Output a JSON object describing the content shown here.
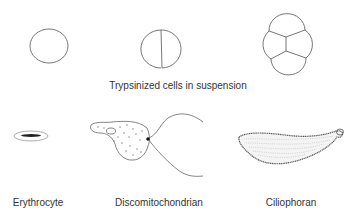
{
  "diagram": {
    "top_row": {
      "caption": "Trypsinized cells in suspension",
      "figures": [
        {
          "name": "single-cell",
          "cells": 1
        },
        {
          "name": "two-cell",
          "cells": 2
        },
        {
          "name": "four-cell",
          "cells": 4
        }
      ]
    },
    "bottom_row": {
      "figures": [
        {
          "label": "Erythrocyte"
        },
        {
          "label": "Discomitochondrian"
        },
        {
          "label": "Ciliophoran"
        }
      ]
    },
    "colors": {
      "line": "#666666",
      "text": "#333333",
      "background": "#ffffff"
    }
  }
}
